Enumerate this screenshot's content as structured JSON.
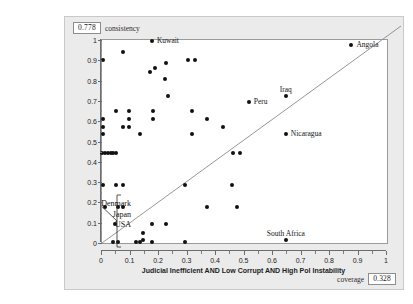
{
  "fields": {
    "consistency_value": "0.778",
    "consistency_label": "consistency",
    "coverage_label": "coverage",
    "coverage_value": "0.328"
  },
  "annotation": {
    "lines": [
      "Denmark",
      "Japan",
      "USA"
    ],
    "points_to": [
      0.01,
      0.175
    ]
  },
  "chart_data": {
    "type": "scatter",
    "title": "",
    "xlabel": "Judicial Inefficient AND Low Corrupt AND High Pol Instability",
    "ylabel": "GDP Annual Growth Calibrated",
    "xlim": [
      0,
      1
    ],
    "ylim": [
      0,
      1
    ],
    "xticks": [
      0,
      0.1,
      0.2,
      0.3,
      0.4,
      0.5,
      0.6,
      0.7,
      0.8,
      0.9,
      1
    ],
    "yticks": [
      0,
      0.1,
      0.2,
      0.3,
      0.4,
      0.5,
      0.6,
      0.7,
      0.8,
      0.9,
      1
    ],
    "xticklabels": [
      "0",
      "0.1",
      "0.2",
      "0.3",
      "0.4",
      "0.5",
      "0.6",
      "0.7",
      "0.8",
      "0.9",
      "1"
    ],
    "yticklabels": [
      "0",
      "0.1",
      "0.2",
      "0.3",
      "0.4",
      "0.5",
      "0.6",
      "0.7",
      "0.8",
      "0.9",
      "1"
    ],
    "grid": false,
    "legend": false,
    "reference_line": {
      "type": "diagonal",
      "from": [
        0,
        0
      ],
      "to": [
        1,
        1
      ]
    },
    "marker_color": "#111111",
    "points": [
      {
        "x": 0.175,
        "y": 0.995,
        "label": "Kuwait",
        "label_pos": "right"
      },
      {
        "x": 0.875,
        "y": 0.975,
        "label": "Angola",
        "label_pos": "right"
      },
      {
        "x": 0.515,
        "y": 0.695,
        "label": "Peru",
        "label_pos": "right"
      },
      {
        "x": 0.645,
        "y": 0.725,
        "label": "Iraq",
        "label_pos": "above"
      },
      {
        "x": 0.645,
        "y": 0.535,
        "label": "Nicaragua",
        "label_pos": "right"
      },
      {
        "x": 0.645,
        "y": 0.015,
        "label": "South Africa",
        "label_pos": "above"
      },
      {
        "x": 0.005,
        "y": 0.9,
        "label": null
      },
      {
        "x": 0.075,
        "y": 0.94,
        "label": null
      },
      {
        "x": 0.225,
        "y": 0.885,
        "label": null
      },
      {
        "x": 0.3,
        "y": 0.9,
        "label": null
      },
      {
        "x": 0.325,
        "y": 0.9,
        "label": null
      },
      {
        "x": 0.185,
        "y": 0.86,
        "label": null
      },
      {
        "x": 0.17,
        "y": 0.84,
        "label": null
      },
      {
        "x": 0.22,
        "y": 0.81,
        "label": null
      },
      {
        "x": 0.23,
        "y": 0.725,
        "label": null
      },
      {
        "x": 0.05,
        "y": 0.65,
        "label": null
      },
      {
        "x": 0.095,
        "y": 0.65,
        "label": null
      },
      {
        "x": 0.18,
        "y": 0.65,
        "label": null
      },
      {
        "x": 0.315,
        "y": 0.65,
        "label": null
      },
      {
        "x": 0.005,
        "y": 0.61,
        "label": null
      },
      {
        "x": 0.095,
        "y": 0.61,
        "label": null
      },
      {
        "x": 0.18,
        "y": 0.61,
        "label": null
      },
      {
        "x": 0.37,
        "y": 0.61,
        "label": null
      },
      {
        "x": 0.005,
        "y": 0.57,
        "label": null
      },
      {
        "x": 0.075,
        "y": 0.57,
        "label": null
      },
      {
        "x": 0.095,
        "y": 0.57,
        "label": null
      },
      {
        "x": 0.425,
        "y": 0.57,
        "label": null
      },
      {
        "x": 0.005,
        "y": 0.535,
        "label": null
      },
      {
        "x": 0.135,
        "y": 0.535,
        "label": null
      },
      {
        "x": 0.315,
        "y": 0.535,
        "label": null
      },
      {
        "x": 0.0,
        "y": 0.445,
        "label": null
      },
      {
        "x": 0.01,
        "y": 0.445,
        "label": null
      },
      {
        "x": 0.02,
        "y": 0.445,
        "label": null
      },
      {
        "x": 0.03,
        "y": 0.445,
        "label": null
      },
      {
        "x": 0.04,
        "y": 0.445,
        "label": null
      },
      {
        "x": 0.05,
        "y": 0.445,
        "label": null
      },
      {
        "x": 0.46,
        "y": 0.445,
        "label": null
      },
      {
        "x": 0.485,
        "y": 0.445,
        "label": null
      },
      {
        "x": 0.005,
        "y": 0.285,
        "label": null
      },
      {
        "x": 0.05,
        "y": 0.285,
        "label": null
      },
      {
        "x": 0.075,
        "y": 0.285,
        "label": null
      },
      {
        "x": 0.29,
        "y": 0.285,
        "label": null
      },
      {
        "x": 0.455,
        "y": 0.285,
        "label": null
      },
      {
        "x": 0.01,
        "y": 0.175,
        "label": null
      },
      {
        "x": 0.055,
        "y": 0.175,
        "label": null
      },
      {
        "x": 0.075,
        "y": 0.175,
        "label": null
      },
      {
        "x": 0.37,
        "y": 0.175,
        "label": null
      },
      {
        "x": 0.475,
        "y": 0.175,
        "label": null
      },
      {
        "x": 0.045,
        "y": 0.095,
        "label": null
      },
      {
        "x": 0.175,
        "y": 0.095,
        "label": null
      },
      {
        "x": 0.225,
        "y": 0.095,
        "label": null
      },
      {
        "x": 0.145,
        "y": 0.05,
        "label": null
      },
      {
        "x": 0.145,
        "y": 0.015,
        "label": null
      },
      {
        "x": 0.04,
        "y": 0.005,
        "label": null
      },
      {
        "x": 0.055,
        "y": 0.005,
        "label": null
      },
      {
        "x": 0.12,
        "y": 0.005,
        "label": null
      },
      {
        "x": 0.135,
        "y": 0.005,
        "label": null
      },
      {
        "x": 0.175,
        "y": 0.005,
        "label": null
      },
      {
        "x": 0.29,
        "y": 0.005,
        "label": null
      }
    ]
  }
}
